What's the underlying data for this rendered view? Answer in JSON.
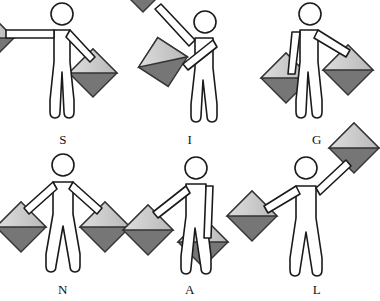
{
  "image": {
    "title": "Semaphore flag signaling figures",
    "background_color": "#ffffff",
    "width": 380,
    "height": 301,
    "columns": 3,
    "rows": 2,
    "spelled_word": "SIGNAL"
  },
  "style": {
    "outline_color": "#1a1a1a",
    "body_fill": "#ffffff",
    "flag_light": "#d9d9d9",
    "flag_mid": "#bdbdbd",
    "flag_dark": "#767676",
    "flag_outline": "#333333",
    "label_color": "#111111",
    "stroke_width": 1.6
  },
  "figures": [
    {
      "label": "S",
      "name": "semaphore-figure-s",
      "description": "Left arm straight out horizontal to the left, right arm angled down to the right",
      "left_arm_angle_deg": 180,
      "right_arm_angle_deg": 315,
      "left_flag_visible": "partial-clipped-left-edge",
      "right_flag_visible": "full"
    },
    {
      "label": "I",
      "name": "semaphore-figure-i",
      "description": "Left arm raised high up to the upper left, right arm down across the body to the lower left",
      "left_arm_angle_deg": 135,
      "right_arm_angle_deg": 225,
      "left_flag_visible": "partial-clipped-top-edge",
      "right_flag_visible": "full"
    },
    {
      "label": "G",
      "name": "semaphore-figure-g",
      "description": "Left arm hanging down close to the body, right arm angled down to the right",
      "left_arm_angle_deg": 260,
      "right_arm_angle_deg": 315,
      "left_flag_visible": "full",
      "right_flag_visible": "full"
    },
    {
      "label": "N",
      "name": "semaphore-figure-n",
      "description": "Both arms angled down and out symmetrically at forty-five degrees",
      "left_arm_angle_deg": 225,
      "right_arm_angle_deg": 315,
      "left_flag_visible": "full",
      "right_flag_visible": "full"
    },
    {
      "label": "A",
      "name": "semaphore-figure-a",
      "description": "Left arm angled down to the left, right arm hanging straight down in front of the body",
      "left_arm_angle_deg": 225,
      "right_arm_angle_deg": 272,
      "left_flag_visible": "full",
      "right_flag_visible": "full"
    },
    {
      "label": "L",
      "name": "semaphore-figure-l",
      "description": "Left arm angled down to the left, right arm raised high up to the upper right",
      "left_arm_angle_deg": 205,
      "right_arm_angle_deg": 40,
      "left_flag_visible": "full",
      "right_flag_visible": "partial-clipped-right-edge"
    }
  ]
}
